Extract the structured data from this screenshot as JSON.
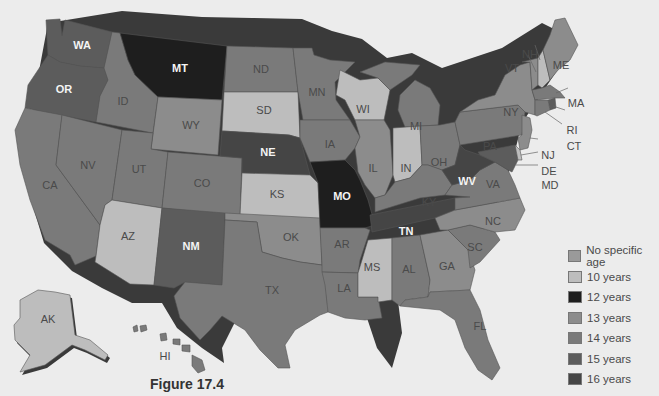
{
  "figure": {
    "caption": "Figure 17.4"
  },
  "legend": {
    "items": [
      {
        "label": "No specific age",
        "color": "#9a9a9a"
      },
      {
        "label": "10 years",
        "color": "#bdbdbd"
      },
      {
        "label": "12 years",
        "color": "#1e1e1e"
      },
      {
        "label": "13 years",
        "color": "#8c8c8c"
      },
      {
        "label": "14 years",
        "color": "#7a7a7a"
      },
      {
        "label": "15 years",
        "color": "#5c5c5c"
      },
      {
        "label": "16 years",
        "color": "#454545"
      }
    ]
  },
  "states": {
    "WA": {
      "label": "WA",
      "category": "15 years"
    },
    "OR": {
      "label": "OR",
      "category": "15 years"
    },
    "CA": {
      "label": "CA",
      "category": "14 years"
    },
    "NV": {
      "label": "NV",
      "category": "14 years"
    },
    "ID": {
      "label": "ID",
      "category": "14 years"
    },
    "MT": {
      "label": "MT",
      "category": "12 years"
    },
    "WY": {
      "label": "WY",
      "category": "13 years"
    },
    "UT": {
      "label": "UT",
      "category": "14 years"
    },
    "CO": {
      "label": "CO",
      "category": "14 years"
    },
    "AZ": {
      "label": "AZ",
      "category": "10 years"
    },
    "NM": {
      "label": "NM",
      "category": "15 years"
    },
    "ND": {
      "label": "ND",
      "category": "14 years"
    },
    "SD": {
      "label": "SD",
      "category": "10 years"
    },
    "NE": {
      "label": "NE",
      "category": "16 years"
    },
    "KS": {
      "label": "KS",
      "category": "10 years"
    },
    "OK": {
      "label": "OK",
      "category": "13 years"
    },
    "TX": {
      "label": "TX",
      "category": "14 years"
    },
    "MN": {
      "label": "MN",
      "category": "14 years"
    },
    "IA": {
      "label": "IA",
      "category": "14 years"
    },
    "MO": {
      "label": "MO",
      "category": "12 years"
    },
    "AR": {
      "label": "AR",
      "category": "14 years"
    },
    "LA": {
      "label": "LA",
      "category": "14 years"
    },
    "WI": {
      "label": "WI",
      "category": "10 years"
    },
    "IL": {
      "label": "IL",
      "category": "13 years"
    },
    "MI": {
      "label": "MI",
      "category": "14 years"
    },
    "IN": {
      "label": "IN",
      "category": "10 years"
    },
    "OH": {
      "label": "OH",
      "category": "14 years"
    },
    "KY": {
      "label": "KY",
      "category": "14 years"
    },
    "TN": {
      "label": "TN",
      "category": "16 years"
    },
    "MS": {
      "label": "MS",
      "category": "10 years"
    },
    "AL": {
      "label": "AL",
      "category": "14 years"
    },
    "GA": {
      "label": "GA",
      "category": "13 years"
    },
    "FL": {
      "label": "FL",
      "category": "14 years"
    },
    "SC": {
      "label": "SC",
      "category": "14 years"
    },
    "NC": {
      "label": "NC",
      "category": "13 years"
    },
    "VA": {
      "label": "VA",
      "category": "14 years"
    },
    "WV": {
      "label": "WV",
      "category": "16 years"
    },
    "PA": {
      "label": "PA",
      "category": "14 years"
    },
    "NY": {
      "label": "NY",
      "category": "13 years"
    },
    "VT": {
      "label": "VT",
      "category": "13 years"
    },
    "NH": {
      "label": "NH",
      "category": "10 years"
    },
    "ME": {
      "label": "ME",
      "category": "13 years"
    },
    "MA": {
      "label": "MA",
      "category": "14 years"
    },
    "RI": {
      "label": "RI",
      "category": "15 years"
    },
    "CT": {
      "label": "CT",
      "category": "14 years"
    },
    "NJ": {
      "label": "NJ",
      "category": "13 years"
    },
    "DE": {
      "label": "DE",
      "category": "10 years"
    },
    "MD": {
      "label": "MD",
      "category": "15 years"
    },
    "AK": {
      "label": "AK",
      "category": "10 years"
    },
    "HI": {
      "label": "HI",
      "category": "14 years"
    }
  }
}
